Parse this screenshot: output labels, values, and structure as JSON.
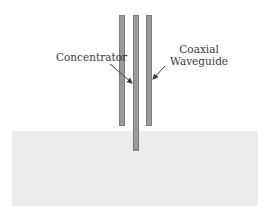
{
  "diagram": {
    "labels": {
      "concentrator": "Concentrator",
      "coaxial_line1": "Coaxial",
      "coaxial_line2": "Waveguide"
    },
    "colors": {
      "conductor": "#9a9a9a",
      "medium": "#ececec",
      "text": "#3a3a3a"
    }
  }
}
